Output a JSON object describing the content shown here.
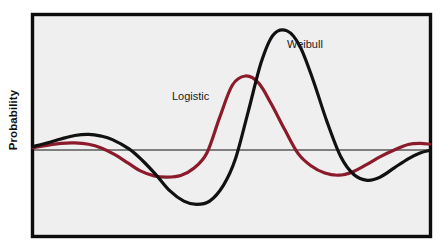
{
  "figure": {
    "y_axis_label": "Probability",
    "background_color": "#ffffff",
    "plot_background_color": "#f0efef",
    "frame_color": "#0d0d0d"
  },
  "labels": {
    "weibull": "Weibull",
    "logistic": "Logistic"
  },
  "chart_data": {
    "type": "line",
    "title": "",
    "xlabel": "",
    "ylabel": "Probability",
    "grid": false,
    "legend": "inline-annotations",
    "axis_ticks": {
      "x": [],
      "y": []
    },
    "zero_line": true,
    "xlim": [
      0,
      1
    ],
    "ylim": [
      -1.15,
      1.15
    ],
    "series": [
      {
        "name": "Weibull",
        "color": "#111111",
        "linewidth": 3.2,
        "label_position": {
          "x": 0.639,
          "y": 0.83
        },
        "x": [
          0.0,
          0.035,
          0.07,
          0.105,
          0.14,
          0.172,
          0.2,
          0.242,
          0.275,
          0.31,
          0.345,
          0.38,
          0.412,
          0.445,
          0.48,
          0.51,
          0.542,
          0.575,
          0.605,
          0.64,
          0.672,
          0.705,
          0.74,
          0.775,
          0.808,
          0.842,
          0.875,
          0.91,
          0.945,
          0.975,
          1.0
        ],
        "y": [
          0.03,
          0.06,
          0.095,
          0.125,
          0.135,
          0.12,
          0.09,
          0.01,
          -0.14,
          -0.34,
          -0.56,
          -0.7,
          -0.745,
          -0.7,
          -0.48,
          -0.12,
          0.33,
          0.76,
          0.995,
          1.03,
          0.9,
          0.61,
          0.25,
          -0.09,
          -0.335,
          -0.415,
          -0.37,
          -0.245,
          -0.12,
          -0.04,
          -0.005
        ]
      },
      {
        "name": "Logistic",
        "color": "#8b1a2b",
        "linewidth": 3.2,
        "label_position": {
          "x": 0.352,
          "y": 0.42
        },
        "x": [
          0.0,
          0.035,
          0.07,
          0.105,
          0.14,
          0.172,
          0.205,
          0.24,
          0.272,
          0.305,
          0.338,
          0.372,
          0.405,
          0.438,
          0.47,
          0.502,
          0.535,
          0.568,
          0.6,
          0.635,
          0.668,
          0.7,
          0.735,
          0.77,
          0.805,
          0.84,
          0.875,
          0.91,
          0.945,
          0.975,
          1.0
        ],
        "y": [
          0.02,
          0.04,
          0.058,
          0.062,
          0.05,
          0.018,
          -0.06,
          -0.18,
          -0.29,
          -0.355,
          -0.372,
          -0.35,
          -0.25,
          -0.04,
          0.28,
          0.56,
          0.64,
          0.58,
          0.4,
          0.17,
          -0.05,
          -0.215,
          -0.315,
          -0.345,
          -0.3,
          -0.2,
          -0.09,
          0.0,
          0.048,
          0.058,
          0.05
        ]
      }
    ],
    "plot_area_px": {
      "left": 31,
      "top": 13,
      "right": 432,
      "bottom": 238
    },
    "zero_line_y_px": 150
  }
}
